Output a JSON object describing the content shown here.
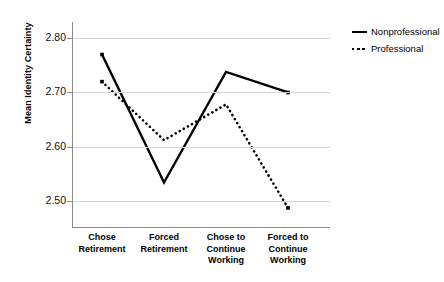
{
  "chart_data": {
    "type": "line",
    "title": "",
    "xlabel": "",
    "ylabel": "Mean Identity Certainty",
    "categories": [
      "Chose Retirement",
      "Forced Retirement",
      "Chose to Continue Working",
      "Forced to Continue Working"
    ],
    "category_lines": [
      [
        "Chose",
        "Retirement"
      ],
      [
        "Forced",
        "Retirement"
      ],
      [
        "Chose to",
        "Continue",
        "Working"
      ],
      [
        "Forced to",
        "Continue",
        "Working"
      ]
    ],
    "series": [
      {
        "name": "Nonprofessional",
        "style": "solid",
        "color": "#000000",
        "values": [
          2.77,
          2.534,
          2.738,
          2.7
        ]
      },
      {
        "name": "Professional",
        "style": "dotted",
        "color": "#000000",
        "values": [
          2.72,
          2.612,
          2.678,
          2.487
        ]
      }
    ],
    "ylim": [
      2.45,
      2.83
    ],
    "yticks": [
      2.5,
      2.6,
      2.7,
      2.8
    ],
    "ytick_labels": [
      "2.50",
      "2.60",
      "2.70",
      "2.80"
    ],
    "grid": true,
    "grid_axis": "y",
    "legend_position": "right"
  },
  "legend": {
    "entries": [
      {
        "label": "Nonprofessional",
        "swatch": "solid-line-swatch"
      },
      {
        "label": "Professional",
        "swatch": "dotted-line-swatch"
      }
    ]
  }
}
